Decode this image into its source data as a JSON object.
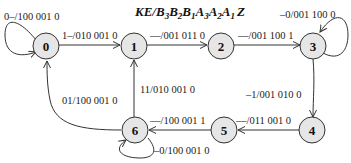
{
  "title": {
    "prefix": "KE/B",
    "parts": [
      "KE/B",
      "3",
      "B",
      "2",
      "B",
      "1",
      "A",
      "3",
      "A",
      "2",
      "A",
      "1",
      "Z"
    ]
  },
  "states": [
    {
      "id": "0",
      "label": "0"
    },
    {
      "id": "1",
      "label": "1"
    },
    {
      "id": "2",
      "label": "2"
    },
    {
      "id": "3",
      "label": "3"
    },
    {
      "id": "4",
      "label": "4"
    },
    {
      "id": "5",
      "label": "5"
    },
    {
      "id": "6",
      "label": "6"
    }
  ],
  "transitions": [
    {
      "from": "0",
      "to": "0",
      "label": "0–/100 001 0"
    },
    {
      "from": "0",
      "to": "1",
      "label": "1–/010 001 0"
    },
    {
      "from": "1",
      "to": "2",
      "label": "––/001 011 0"
    },
    {
      "from": "2",
      "to": "3",
      "label": "––/001 100 1"
    },
    {
      "from": "3",
      "to": "3",
      "label": "–0/001 100 0"
    },
    {
      "from": "3",
      "to": "4",
      "label": "–1/001 010 0"
    },
    {
      "from": "4",
      "to": "5",
      "label": "––/011 001 0"
    },
    {
      "from": "5",
      "to": "6",
      "label": "––/100 001 1"
    },
    {
      "from": "6",
      "to": "6",
      "label": "–0/100 001 0"
    },
    {
      "from": "6",
      "to": "1",
      "label": "11/010 001 0"
    },
    {
      "from": "6",
      "to": "0",
      "label": "01/100 001 0"
    }
  ]
}
